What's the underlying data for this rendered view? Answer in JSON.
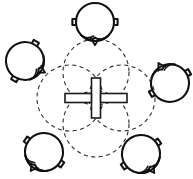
{
  "figure": {
    "type": "technical-line-drawing",
    "background_color": "#ffffff",
    "ink_color": "#1a1a1a",
    "canvas": {
      "width": 193,
      "height": 179
    }
  },
  "chart_data": {
    "type": "scatter",
    "xlabel": "",
    "ylabel": "",
    "xlim": [
      0,
      193
    ],
    "ylim": [
      0,
      179
    ],
    "grid": false,
    "legend": "none",
    "series": [
      {
        "name": "dashed-orbit-circles",
        "style": "dashed",
        "radius": 33,
        "points": [
          {
            "label": "orbit-top",
            "x": 96,
            "y": 72
          },
          {
            "label": "orbit-left",
            "x": 70,
            "y": 98
          },
          {
            "label": "orbit-right",
            "x": 122,
            "y": 98
          },
          {
            "label": "orbit-bottom",
            "x": 96,
            "y": 124
          }
        ]
      },
      {
        "name": "clamped-ring-satellites",
        "style": "solid",
        "radius": 19,
        "points": [
          {
            "label": "ring-top",
            "x": 95,
            "y": 22,
            "rotation": 0
          },
          {
            "label": "ring-left",
            "x": 25,
            "y": 61,
            "rotation": 300
          },
          {
            "label": "ring-right",
            "x": 170,
            "y": 83,
            "rotation": 150
          },
          {
            "label": "ring-bottom-left",
            "x": 44,
            "y": 152,
            "rotation": 35
          },
          {
            "label": "ring-bottom-right",
            "x": 141,
            "y": 154,
            "rotation": 325
          }
        ]
      },
      {
        "name": "center-cross-hub",
        "style": "outlined-bars",
        "points": [
          {
            "label": "cross-center",
            "x": 96,
            "y": 98
          }
        ],
        "horizontal_bar": {
          "width": 62,
          "height": 9
        },
        "vertical_bar": {
          "width": 9,
          "height": 40
        }
      }
    ]
  },
  "elements": {
    "center_cross": {
      "name": "center-cross-hub",
      "center_x": 96,
      "center_y": 98,
      "h_bar_width": 62,
      "h_bar_height": 9,
      "v_bar_width": 9,
      "v_bar_height": 40,
      "stroke": "#1a1a1a",
      "fill": "#ffffff",
      "stroke_width": 1.6
    },
    "orbits": {
      "name": "dashed-orbit-group",
      "radius": 33,
      "stroke": "#2b2b2b",
      "stroke_width": 1.1,
      "dash_pattern": "4 3.5",
      "items": [
        {
          "name": "orbit-top",
          "cx": 96,
          "cy": 72
        },
        {
          "name": "orbit-left",
          "cx": 70,
          "cy": 98
        },
        {
          "name": "orbit-right",
          "cx": 122,
          "cy": 98
        },
        {
          "name": "orbit-bottom",
          "cx": 96,
          "cy": 124
        }
      ]
    },
    "satellites": {
      "name": "clamped-ring-group",
      "radius": 19,
      "stroke": "#111111",
      "stroke_width": 2.1,
      "items": [
        {
          "name": "ring-top",
          "cx": 95,
          "cy": 22,
          "rotation": 0
        },
        {
          "name": "ring-left",
          "cx": 25,
          "cy": 61,
          "rotation": 300
        },
        {
          "name": "ring-right",
          "cx": 170,
          "cy": 83,
          "rotation": 150
        },
        {
          "name": "ring-bottom-left",
          "cx": 44,
          "cy": 152,
          "rotation": 35
        },
        {
          "name": "ring-bottom-right",
          "cx": 141,
          "cy": 154,
          "rotation": 325
        }
      ]
    }
  }
}
